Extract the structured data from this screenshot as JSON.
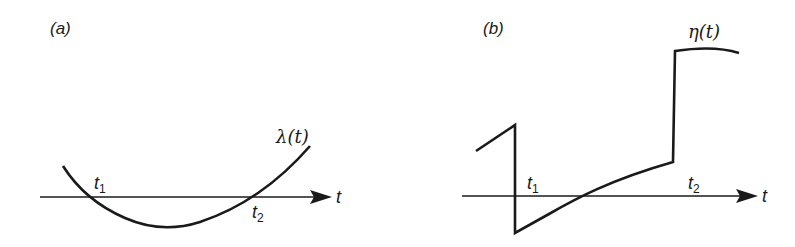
{
  "figure": {
    "panels": [
      {
        "id": "a",
        "label": "(a)",
        "axis_label": "t",
        "curve_label": "λ(t)",
        "points": [
          {
            "name": "t",
            "sub": "1"
          },
          {
            "name": "t",
            "sub": "2"
          }
        ],
        "description": "Smooth convex curve λ(t) crossing the t-axis downward at t1 and upward at t2, negative between them"
      },
      {
        "id": "b",
        "label": "(b)",
        "axis_label": "t",
        "curve_label": "η(t)",
        "points": [
          {
            "name": "t",
            "sub": "1"
          },
          {
            "name": "t",
            "sub": "2"
          }
        ],
        "description": "Piecewise curve η(t): rising segment, vertical drop at t1 to negative value, rising curve crossing zero, then vertical jump up before t2 to a high plateau"
      }
    ],
    "stroke_color": "#1a1a1a",
    "background": "#ffffff"
  }
}
